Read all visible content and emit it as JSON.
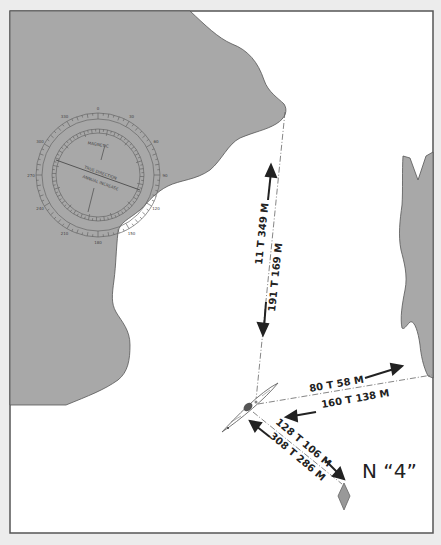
{
  "figure": {
    "background_color": "#ececec",
    "frame_color": "#555555",
    "water_color": "#ffffff",
    "land_color": "#a8a8a8",
    "land_stroke": "#555555"
  },
  "compass_rose": {
    "outer_ticks": [
      "0",
      "30",
      "60",
      "90",
      "120",
      "150",
      "180",
      "210",
      "240",
      "270",
      "300",
      "330"
    ],
    "inner_text_line1": "MAGNETIC",
    "inner_text_line2": "TRUE DIRECTION",
    "inner_text_line3": "ANNUAL INCREASE"
  },
  "bearings": {
    "north_line": {
      "outbound_label": "11 T   349 M",
      "return_label": "191 T   169 M"
    },
    "east_line": {
      "outbound_label": "80 T   58 M",
      "return_label": "160 T   138 M"
    },
    "marker_line": {
      "outbound_label": "128 T 106 M",
      "return_label": "308 T 286 M"
    }
  },
  "marker": {
    "label": "N “4”",
    "color": "#999999"
  }
}
